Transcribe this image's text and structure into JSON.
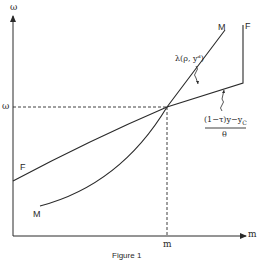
{
  "diagram": {
    "y_axis_label": "ω",
    "x_axis_label": "m",
    "y_tick_label": "ω",
    "x_tick_label": "m",
    "caption": "Figure 1",
    "curves": [
      {
        "id": "F",
        "label_start": "F",
        "label_end": "F",
        "description": "piecewise linear: rising line then vertical segment"
      },
      {
        "id": "M",
        "label_start": "M",
        "label_end": "M",
        "description": "convex upward-sloping curve"
      }
    ],
    "annotations": {
      "m_curve": "λ(ρ, yᵈ)",
      "f_curve_numerator": "(1−τ)y−y",
      "f_curve_numerator_sub": "C",
      "f_curve_denominator": "θ"
    },
    "colors": {
      "line": "#2a2a2a",
      "background": "#ffffff"
    }
  }
}
